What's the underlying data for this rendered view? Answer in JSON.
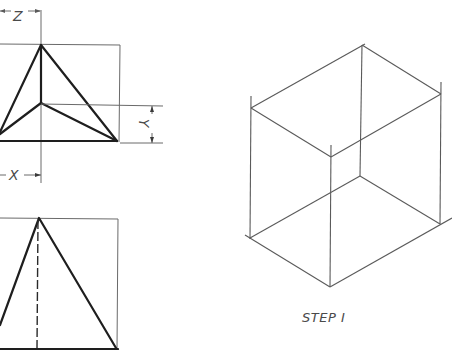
{
  "figure": {
    "left_views": {
      "top_view": {
        "name": "top-view-projection",
        "dimensions": {
          "z": "Z",
          "y": "Y",
          "x": "X"
        }
      },
      "front_view": {
        "name": "front-view-projection",
        "hidden_line": "dashed"
      }
    },
    "isometric_view": {
      "name": "isometric-bounding-box",
      "caption": "STEP I"
    }
  },
  "colors": {
    "object_line": "#1e1e1e",
    "construction_line": "#6a6a6a",
    "text": "#4a4a4a",
    "background": "#ffffff"
  }
}
